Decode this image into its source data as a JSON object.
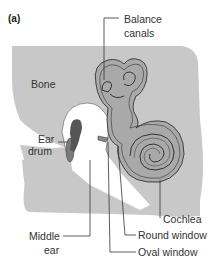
{
  "figure": {
    "panel_label": "(a)",
    "labels": {
      "balance_canals_1": "Balance",
      "balance_canals_2": "canals",
      "bone": "Bone",
      "ear_drum_1": "Ear",
      "ear_drum_2": "drum",
      "middle_ear_1": "Middle",
      "middle_ear_2": "ear",
      "cochlea": "Cochlea",
      "round_window": "Round window",
      "oval_window": "Oval window"
    },
    "colors": {
      "bone": "#c8c8c8",
      "labyrinth": "#a9a9a9",
      "outline": "#333333",
      "eardrum": "#7a7a7a",
      "ossicle": "#555555"
    }
  }
}
